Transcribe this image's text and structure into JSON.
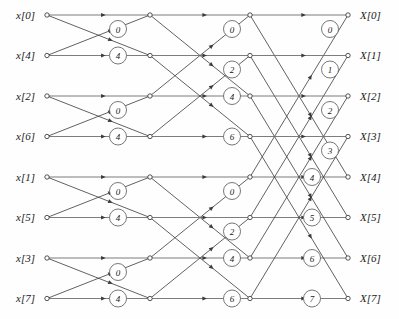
{
  "figure": {
    "type": "signal-flow-graph",
    "stages": 3,
    "points": 8
  },
  "inputs": {
    "label_prefix": "x",
    "items": [
      {
        "row": 0,
        "label": "x[0]"
      },
      {
        "row": 1,
        "label": "x[4]"
      },
      {
        "row": 2,
        "label": "x[2]"
      },
      {
        "row": 3,
        "label": "x[6]"
      },
      {
        "row": 4,
        "label": "x[1]"
      },
      {
        "row": 5,
        "label": "x[5]"
      },
      {
        "row": 6,
        "label": "x[3]"
      },
      {
        "row": 7,
        "label": "x[7]"
      }
    ]
  },
  "outputs": {
    "label_prefix": "X",
    "items": [
      {
        "row": 0,
        "label": "X[0]"
      },
      {
        "row": 1,
        "label": "X[1]"
      },
      {
        "row": 2,
        "label": "X[2]"
      },
      {
        "row": 3,
        "label": "X[3]"
      },
      {
        "row": 4,
        "label": "X[4]"
      },
      {
        "row": 5,
        "label": "X[5]"
      },
      {
        "row": 6,
        "label": "X[6]"
      },
      {
        "row": 7,
        "label": "X[7]"
      }
    ]
  },
  "twiddles": {
    "stage1": [
      {
        "row": 0,
        "value": "0"
      },
      {
        "row": 1,
        "value": "4"
      },
      {
        "row": 2,
        "value": "0"
      },
      {
        "row": 3,
        "value": "4"
      },
      {
        "row": 4,
        "value": "0"
      },
      {
        "row": 5,
        "value": "4"
      },
      {
        "row": 6,
        "value": "0"
      },
      {
        "row": 7,
        "value": "4"
      }
    ],
    "stage2": [
      {
        "row": 0,
        "value": "0"
      },
      {
        "row": 1,
        "value": "2"
      },
      {
        "row": 2,
        "value": "4"
      },
      {
        "row": 3,
        "value": "6"
      },
      {
        "row": 4,
        "value": "0"
      },
      {
        "row": 5,
        "value": "2"
      },
      {
        "row": 6,
        "value": "4"
      },
      {
        "row": 7,
        "value": "6"
      }
    ],
    "stage3": [
      {
        "row": 0,
        "value": "0"
      },
      {
        "row": 1,
        "value": "1"
      },
      {
        "row": 2,
        "value": "2"
      },
      {
        "row": 3,
        "value": "3"
      },
      {
        "row": 4,
        "value": "4"
      },
      {
        "row": 5,
        "value": "5"
      },
      {
        "row": 6,
        "value": "6"
      },
      {
        "row": 7,
        "value": "7"
      }
    ]
  },
  "geometry": {
    "col_input": 47,
    "col_stage1": 150,
    "col_stage2": 250,
    "col_stage3": 348,
    "row_top": 15,
    "row_step": 40.5,
    "node_radius": 2.2,
    "twiddle_radius": 8.5
  },
  "colors": {
    "line": "#3a3a3a",
    "line_horizontal": "#6e6e6e",
    "text": "#1a1a1a",
    "background": "#fefefe",
    "node_fill": "#ffffff"
  }
}
